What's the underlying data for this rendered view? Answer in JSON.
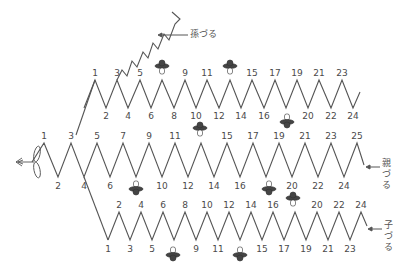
{
  "diagram": {
    "labels": {
      "grandchild_vine": "孫づる",
      "parent_vine": "親づる",
      "child_vine": "子づる"
    },
    "icons": {
      "seedling": "seedling-icon",
      "fruit": "fruit-flower-icon"
    },
    "stroke_color": "#555555",
    "rows": {
      "top": {
        "name": "upper-branch",
        "peaks": [
          "1",
          "3",
          "5",
          "7",
          "9",
          "11",
          "13",
          "15",
          "17",
          "19",
          "21",
          "23"
        ],
        "valleys": [
          "2",
          "4",
          "6",
          "8",
          "10",
          "12",
          "14",
          "16",
          "18",
          "20",
          "22",
          "24"
        ],
        "fruit_at": [
          "7",
          "13",
          "18"
        ]
      },
      "middle": {
        "name": "parent-vine",
        "peaks": [
          "1",
          "3",
          "5",
          "7",
          "9",
          "11",
          "13",
          "15",
          "17",
          "19",
          "21",
          "23",
          "25"
        ],
        "valleys": [
          "2",
          "4",
          "6",
          "8",
          "10",
          "12",
          "14",
          "16",
          "18",
          "20",
          "22",
          "24"
        ],
        "fruit_at": [
          "8",
          "13",
          "18"
        ]
      },
      "bottom": {
        "name": "child-vine",
        "peaks": [
          "2",
          "4",
          "6",
          "8",
          "10",
          "12",
          "14",
          "16",
          "18",
          "20",
          "22",
          "24"
        ],
        "valleys": [
          "1",
          "3",
          "5",
          "7",
          "9",
          "11",
          "13",
          "15",
          "17",
          "19",
          "21",
          "23"
        ],
        "fruit_at": [
          "7",
          "13",
          "18"
        ]
      }
    }
  }
}
